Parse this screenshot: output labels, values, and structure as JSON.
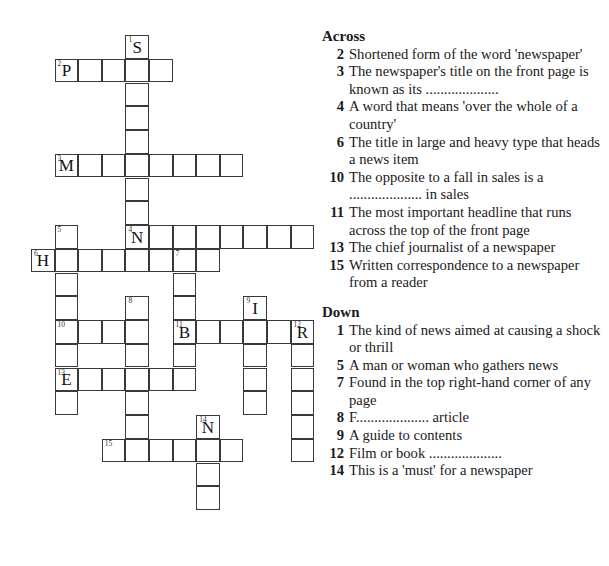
{
  "grid": {
    "origin_x": 31,
    "origin_y": 35,
    "cell_size": 23.6,
    "row_size": 23.75,
    "words": [
      {
        "number": "1",
        "direction": "down",
        "row": 0,
        "col": 4,
        "length": 10,
        "given": "S"
      },
      {
        "number": "2",
        "direction": "across",
        "row": 1,
        "col": 1,
        "length": 5,
        "given": "P"
      },
      {
        "number": "3",
        "direction": "across",
        "row": 5,
        "col": 1,
        "length": 8,
        "given": "M"
      },
      {
        "number": "4",
        "direction": "across",
        "row": 8,
        "col": 4,
        "length": 8,
        "given": "N"
      },
      {
        "number": "5",
        "direction": "down",
        "row": 8,
        "col": 1,
        "length": 8,
        "given": ""
      },
      {
        "number": "6",
        "direction": "across",
        "row": 9,
        "col": 0,
        "length": 8,
        "given": "H"
      },
      {
        "number": "7",
        "direction": "down",
        "row": 9,
        "col": 6,
        "length": 6,
        "given": ""
      },
      {
        "number": "8",
        "direction": "down",
        "row": 11,
        "col": 4,
        "length": 7,
        "given": ""
      },
      {
        "number": "9",
        "direction": "down",
        "row": 11,
        "col": 9,
        "length": 5,
        "given": "I"
      },
      {
        "number": "10",
        "direction": "across",
        "row": 12,
        "col": 1,
        "length": 4,
        "given": ""
      },
      {
        "number": "11",
        "direction": "across",
        "row": 12,
        "col": 6,
        "length": 6,
        "given": "B"
      },
      {
        "number": "12",
        "direction": "down",
        "row": 12,
        "col": 11,
        "length": 6,
        "given": "R"
      },
      {
        "number": "13",
        "direction": "across",
        "row": 14,
        "col": 1,
        "length": 6,
        "given": "E"
      },
      {
        "number": "14",
        "direction": "down",
        "row": 16,
        "col": 7,
        "length": 4,
        "given": "N"
      },
      {
        "number": "15",
        "direction": "across",
        "row": 17,
        "col": 3,
        "length": 6,
        "given": ""
      }
    ]
  },
  "clues": {
    "across": {
      "title": "Across",
      "items": [
        {
          "number": "2",
          "text": "Shortened form of the word 'newspaper'"
        },
        {
          "number": "3",
          "text": "The newspaper's title on the front page is known as its ...................."
        },
        {
          "number": "4",
          "text": "A word that means 'over the whole of a country'"
        },
        {
          "number": "6",
          "text": "The title in large and heavy type that heads a news item"
        },
        {
          "number": "10",
          "text": "The opposite to a fall in sales is a .................... in sales"
        },
        {
          "number": "11",
          "text": "The most important headline that runs across the top of the front page"
        },
        {
          "number": "13",
          "text": "The chief journalist of a newspaper"
        },
        {
          "number": "15",
          "text": "Written correspondence to a newspaper from a reader"
        }
      ]
    },
    "down": {
      "title": "Down",
      "items": [
        {
          "number": "1",
          "text": "The kind of news aimed at causing a shock or thrill"
        },
        {
          "number": "5",
          "text": "A man or woman who gathers news"
        },
        {
          "number": "7",
          "text": "Found in the top right-hand corner of any page"
        },
        {
          "number": "8",
          "text": "F.................... article"
        },
        {
          "number": "9",
          "text": "A guide to contents"
        },
        {
          "number": "12",
          "text": "Film or book ...................."
        },
        {
          "number": "14",
          "text": "This is a 'must' for a newspaper"
        }
      ]
    }
  }
}
